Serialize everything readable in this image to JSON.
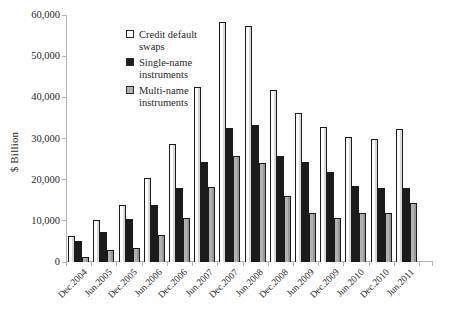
{
  "chart_data": {
    "type": "bar",
    "title": "",
    "xlabel": "",
    "ylabel": "$ Billion",
    "ylim": [
      0,
      60000
    ],
    "yticks": [
      0,
      10000,
      20000,
      30000,
      40000,
      50000,
      60000
    ],
    "ytick_labels": [
      "0",
      "10,000",
      "20,000",
      "30,000",
      "40,000",
      "50,000",
      "60,000"
    ],
    "grid": false,
    "legend_position": "upper-left-inside",
    "categories": [
      "Dec.2004",
      "Jun.2005",
      "Dec.2005",
      "Jun.2006",
      "Dec.2006",
      "Jun.2007",
      "Dec.2007",
      "Jun.2008",
      "Dec.2008",
      "Jun.2009",
      "Dec.2009",
      "Jun.2010",
      "Dec.2010",
      "Jun.2011"
    ],
    "series": [
      {
        "name": "Credit default swaps",
        "color": "#fdfdfd",
        "values": [
          6400,
          10200,
          13900,
          20400,
          28700,
          42600,
          58200,
          57400,
          41900,
          36100,
          32700,
          30300,
          29900,
          32400
        ]
      },
      {
        "name": "Single-name instruments",
        "color": "#1b1b1b",
        "values": [
          5100,
          7300,
          10400,
          13900,
          17900,
          24200,
          32500,
          33400,
          25700,
          24200,
          21900,
          18500,
          18100,
          18100
        ]
      },
      {
        "name": "Multi-name instruments",
        "color": "#b1b1b1",
        "values": [
          1300,
          2900,
          3500,
          6500,
          10800,
          18300,
          25800,
          24000,
          16100,
          11900,
          10800,
          11800,
          11800,
          14300
        ]
      }
    ],
    "colors": {
      "bar_border": "#1b1b1b",
      "axis": "#b5b5b5",
      "text": "#2a2a2a",
      "background": "#fefefe"
    }
  }
}
